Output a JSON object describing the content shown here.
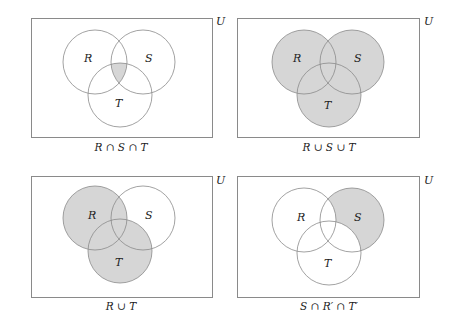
{
  "figure": {
    "universe_label": "U",
    "shade_color": "#d6d6d6",
    "stroke_color": "#8a8a8a",
    "panels": [
      {
        "id": "panel-1",
        "caption": "R ∩ S ∩ T",
        "set_labels": {
          "R": "R",
          "S": "S",
          "T": "T"
        },
        "shaded_region": "intersection of R, S and T"
      },
      {
        "id": "panel-2",
        "caption": "R ∪ S ∪ T",
        "set_labels": {
          "R": "R",
          "S": "S",
          "T": "T"
        },
        "shaded_region": "union of R, S and T"
      },
      {
        "id": "panel-3",
        "caption": "R ∪ T",
        "set_labels": {
          "R": "R",
          "S": "S",
          "T": "T"
        },
        "shaded_region": "union of R and T"
      },
      {
        "id": "panel-4",
        "caption": "S ∩ R′ ∩ T′",
        "set_labels": {
          "R": "R",
          "S": "S",
          "T": "T"
        },
        "shaded_region": "S only (outside R and T)"
      }
    ]
  }
}
